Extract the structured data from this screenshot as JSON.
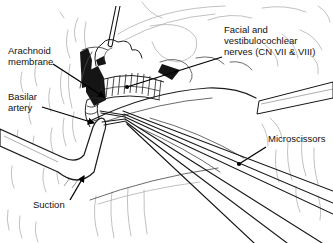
{
  "figure": {
    "kind": "surgical-line-illustration"
  },
  "colors": {
    "ink": "#1a1a1a",
    "tissue_line": "#a6a6a6",
    "background": "#ffffff"
  },
  "annotations": {
    "arachnoid_membrane": {
      "lines": [
        "Arachnoid",
        "membrane"
      ]
    },
    "facial_vestibulocochlear": {
      "lines": [
        "Facial and",
        "vestibulocochlear",
        "nerves (CN VII & VIII)"
      ]
    },
    "basilar_artery": {
      "lines": [
        "Basilar",
        "artery"
      ]
    },
    "microscissors": {
      "lines": [
        "Microscissors"
      ]
    },
    "suction": {
      "lines": [
        "Suction"
      ]
    }
  }
}
